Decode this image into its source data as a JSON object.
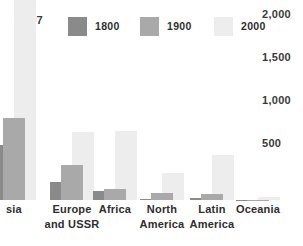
{
  "chart_data": {
    "type": "bar",
    "title": "",
    "subtitle": "",
    "xlabel": "",
    "ylabel": "",
    "ylim": [
      0,
      2000
    ],
    "grid": false,
    "legend_position": "top",
    "y_ticks": [
      "500",
      "1,000",
      "1,500",
      "2,000"
    ],
    "y_tick_values": [
      500,
      1000,
      1500,
      2000
    ],
    "categories": [
      "Asia",
      "Europe\nand USSR",
      "Africa",
      "North\nAmerica",
      "Latin\nAmerica",
      "Oceania"
    ],
    "category_labels_visible": [
      "sia",
      "Europe\nand USSR",
      "Africa",
      "North\nAmerica",
      "Latin\nAmerica",
      "Oceania"
    ],
    "series": [
      {
        "name": "1800",
        "color": "#8a8a8a",
        "values": [
          635,
          203,
          107,
          7,
          24,
          2
        ]
      },
      {
        "name": "1900",
        "color": "#a9a9a9",
        "values": [
          947,
          408,
          133,
          82,
          74,
          6
        ]
      },
      {
        "name": "2000",
        "color": "#ededed",
        "values": [
          3307,
          791,
          794,
          310,
          519,
          30
        ]
      }
    ],
    "annotations": [
      {
        "text": "3,307",
        "series": "2000",
        "category": "Asia",
        "note": "value exceeds axis range"
      }
    ]
  },
  "legend": {
    "items": [
      {
        "label": "1800",
        "color": "#8a8a8a",
        "swatch_name": "legend-swatch-1800"
      },
      {
        "label": "1900",
        "color": "#a9a9a9",
        "swatch_name": "legend-swatch-1900"
      },
      {
        "label": "2000",
        "color": "#ededed",
        "swatch_name": "legend-swatch-2000"
      }
    ]
  }
}
